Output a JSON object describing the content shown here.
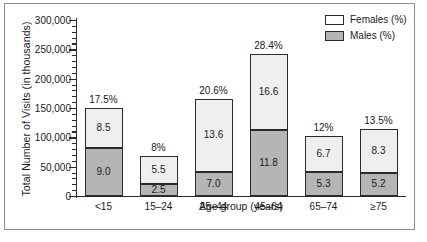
{
  "chart_data": {
    "type": "bar",
    "subtype": "stacked-bar",
    "title": "",
    "xlabel": "Age group (years)",
    "ylabel": "Total Number of Visits (in thousands)",
    "ylim": [
      0,
      300000
    ],
    "ytick_step": 50000,
    "yminor_step": 10000,
    "grid": false,
    "legend_position": "top-right",
    "categories": [
      "<15",
      "15–24",
      "25–44",
      "45–64",
      "65–74",
      "≥75"
    ],
    "ytick_labels": [
      "300,000",
      "250,000",
      "200,000",
      "150,000",
      "100,000",
      "50,000",
      "0"
    ],
    "ytick_values": [
      300000,
      250000,
      200000,
      150000,
      100000,
      50000,
      0
    ],
    "series": [
      {
        "name": "Males (%)",
        "color": "#b5b5b5",
        "values": [
          82000,
          21000,
          41000,
          113000,
          41000,
          40000
        ],
        "data_labels": [
          "9.0",
          "2.5",
          "7.0",
          "11.8",
          "5.3",
          "5.2"
        ]
      },
      {
        "name": "Females (%)",
        "color": "#efefef",
        "values": [
          68000,
          47000,
          125000,
          129000,
          61000,
          75000
        ],
        "data_labels": [
          "8.5",
          "5.5",
          "13.6",
          "16.6",
          "6.7",
          "8.3"
        ]
      }
    ],
    "totals": [
      150000,
      68000,
      166000,
      242000,
      102000,
      115000
    ],
    "total_labels": [
      "17.5%",
      "8%",
      "20.6%",
      "28.4%",
      "12%",
      "13.5%"
    ]
  },
  "legend": {
    "items": [
      {
        "label": "Females (%)",
        "swatch": "white-square-icon"
      },
      {
        "label": "Males (%)",
        "swatch": "gray-square-icon"
      }
    ]
  },
  "colors": {
    "female_fill": "#efefef",
    "male_fill": "#b5b5b5",
    "outline": "#2b2b2b",
    "frame": "#8c8c8c",
    "text": "#1a1a1a",
    "background": "#ffffff"
  }
}
